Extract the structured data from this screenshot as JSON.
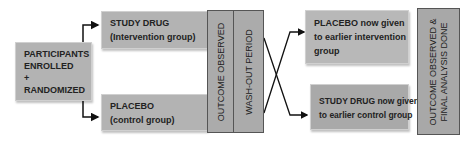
{
  "diagram": {
    "type": "crossover-trial-flowchart",
    "colors": {
      "box_fill": "#b3b3b3",
      "column_fill": "#ababab",
      "line": "#111111",
      "text": "#222222"
    },
    "start": {
      "line1": "PARTICIPANTS",
      "line2": "ENROLLED",
      "line3": "+",
      "line4": "RANDOMIZED"
    },
    "arm_1": {
      "line1": "STUDY DRUG",
      "line2": "(Intervention group)"
    },
    "arm_2": {
      "line1": "PLACEBO",
      "line2": "(control group)"
    },
    "phase_1_outcome": "OUTCOME OBSERVED",
    "washout": "WASH-OUT PERIOD",
    "crossover_1": {
      "line1": "PLACEBO now given",
      "line2": "to earlier intervention",
      "line3": "group"
    },
    "crossover_2": {
      "line1": "STUDY DRUG now given",
      "line2": "to earlier control group"
    },
    "final": {
      "line1": "OUTCOME OBSERVED &",
      "line2": "FINAL ANALYSIS DONE"
    }
  }
}
